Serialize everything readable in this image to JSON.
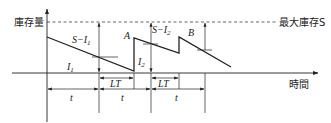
{
  "diagram": {
    "y_axis_label": "庫存量",
    "x_axis_label": "時間",
    "max_line_label": "最大庫存S",
    "point_labels": {
      "a": "A",
      "b": "B"
    },
    "gap_labels": {
      "s_minus_i1": "S−I",
      "s_minus_i1_sub": "1",
      "s_minus_i2": "S−I",
      "s_minus_i2_sub": "2"
    },
    "inventory_labels": {
      "i1": "I",
      "i1_sub": "1",
      "i2": "I",
      "i2_sub": "2"
    },
    "interval_labels": {
      "t1": "t",
      "t2": "t",
      "t3": "t"
    },
    "lead_time_labels": {
      "lt1": "LT",
      "lt2": "LT"
    },
    "colors": {
      "line": "#222222",
      "background": "#ffffff"
    }
  }
}
